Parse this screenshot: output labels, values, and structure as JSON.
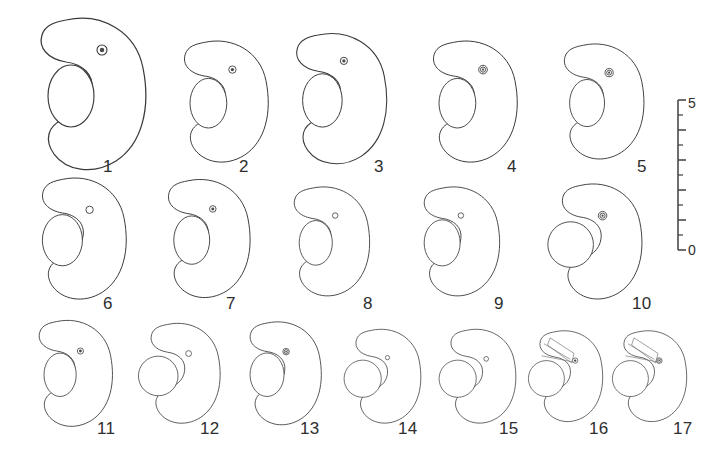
{
  "figure": {
    "type": "scientific-specimen-plate",
    "background_color": "#ffffff",
    "line_color": "#3a3a3a",
    "rows": 3,
    "specimen_count": 17
  },
  "specimens": [
    {
      "label": "1",
      "row": 1,
      "cx": 88,
      "cy": 92,
      "scale": 1.0,
      "lobe_style": "oval-inset",
      "dot": "ring-filled",
      "dot_dx": 14,
      "dot_dy": -42,
      "dot_r": 5.0,
      "extra": "none",
      "label_x": 103,
      "label_y": 158
    },
    {
      "label": "2",
      "row": 1,
      "cx": 222,
      "cy": 100,
      "scale": 0.8,
      "lobe_style": "oval-inset",
      "dot": "ring-filled",
      "dot_dx": 13,
      "dot_dy": -38,
      "dot_r": 4.6,
      "extra": "none",
      "label_x": 239,
      "label_y": 158
    },
    {
      "label": "3",
      "row": 1,
      "cx": 337,
      "cy": 97,
      "scale": 0.86,
      "lobe_style": "oval-inset",
      "dot": "ring-filled",
      "dot_dx": 8,
      "dot_dy": -42,
      "dot_r": 4.2,
      "extra": "none",
      "label_x": 374,
      "label_y": 158
    },
    {
      "label": "4",
      "row": 1,
      "cx": 471,
      "cy": 100,
      "scale": 0.8,
      "lobe_style": "oval-inset",
      "dot": "double-ring",
      "dot_dx": 15,
      "dot_dy": -38,
      "dot_r": 5.4,
      "extra": "none",
      "label_x": 507,
      "label_y": 158
    },
    {
      "label": "5",
      "row": 1,
      "cx": 600,
      "cy": 100,
      "scale": 0.76,
      "lobe_style": "oval-inset",
      "dot": "double-ring",
      "dot_dx": 12,
      "dot_dy": -36,
      "dot_r": 5.4,
      "extra": "none",
      "label_x": 637,
      "label_y": 158
    },
    {
      "label": "6",
      "row": 2,
      "cx": 80,
      "cy": 237,
      "scale": 0.8,
      "lobe_style": "oval-left",
      "dot": "ring-open",
      "dot_dx": 12,
      "dot_dy": -34,
      "dot_r": 4.6,
      "extra": "none",
      "label_x": 103,
      "label_y": 295
    },
    {
      "label": "7",
      "row": 2,
      "cx": 205,
      "cy": 237,
      "scale": 0.78,
      "lobe_style": "oval-inset",
      "dot": "ring-filled",
      "dot_dx": 10,
      "dot_dy": -36,
      "dot_r": 4.2,
      "extra": "none",
      "label_x": 226,
      "label_y": 295
    },
    {
      "label": "8",
      "row": 2,
      "cx": 328,
      "cy": 240,
      "scale": 0.72,
      "lobe_style": "oval-inset",
      "dot": "ring-open",
      "dot_dx": 10,
      "dot_dy": -34,
      "dot_r": 3.8,
      "extra": "none",
      "label_x": 363,
      "label_y": 295
    },
    {
      "label": "9",
      "row": 2,
      "cx": 458,
      "cy": 240,
      "scale": 0.72,
      "lobe_style": "oval-left",
      "dot": "ring-open",
      "dot_dx": 4,
      "dot_dy": -34,
      "dot_r": 3.8,
      "extra": "none",
      "label_x": 494,
      "label_y": 295
    },
    {
      "label": "10",
      "row": 2,
      "cx": 598,
      "cy": 240,
      "scale": 0.76,
      "lobe_style": "circle-protrude",
      "dot": "double-ring",
      "dot_dx": 6,
      "dot_dy": -32,
      "dot_r": 5.6,
      "extra": "none",
      "label_x": 632,
      "label_y": 295
    },
    {
      "label": "11",
      "row": 3,
      "cx": 72,
      "cy": 372,
      "scale": 0.7,
      "lobe_style": "oval-inset",
      "dot": "ring-filled",
      "dot_dx": 12,
      "dot_dy": -30,
      "dot_r": 4.4,
      "extra": "none",
      "label_x": 97,
      "label_y": 420
    },
    {
      "label": "12",
      "row": 3,
      "cx": 182,
      "cy": 372,
      "scale": 0.66,
      "lobe_style": "circle-protrude",
      "dot": "ring-open",
      "dot_dx": 10,
      "dot_dy": -28,
      "dot_r": 4.4,
      "extra": "none",
      "label_x": 200,
      "label_y": 420
    },
    {
      "label": "13",
      "row": 3,
      "cx": 282,
      "cy": 372,
      "scale": 0.68,
      "lobe_style": "oval-left",
      "dot": "double-ring",
      "dot_dx": 6,
      "dot_dy": -30,
      "dot_r": 4.8,
      "extra": "none",
      "label_x": 300,
      "label_y": 420
    },
    {
      "label": "14",
      "row": 3,
      "cx": 385,
      "cy": 375,
      "scale": 0.62,
      "lobe_style": "circle-protrude",
      "dot": "ring-open",
      "dot_dx": 4,
      "dot_dy": -28,
      "dot_r": 3.4,
      "extra": "none",
      "label_x": 398,
      "label_y": 420
    },
    {
      "label": "15",
      "row": 3,
      "cx": 480,
      "cy": 375,
      "scale": 0.62,
      "lobe_style": "circle-protrude",
      "dot": "ring-open",
      "dot_dx": 10,
      "dot_dy": -26,
      "dot_r": 3.8,
      "extra": "none",
      "label_x": 499,
      "label_y": 420
    },
    {
      "label": "16",
      "row": 3,
      "cx": 568,
      "cy": 375,
      "scale": 0.6,
      "lobe_style": "circle-protrude",
      "dot": "ring-filled",
      "dot_dx": 12,
      "dot_dy": -24,
      "dot_r": 4.4,
      "extra": "rays",
      "label_x": 589,
      "label_y": 420
    },
    {
      "label": "17",
      "row": 3,
      "cx": 652,
      "cy": 375,
      "scale": 0.6,
      "lobe_style": "circle-protrude",
      "dot": "double-ring",
      "dot_dx": 12,
      "dot_dy": -24,
      "dot_r": 4.8,
      "extra": "wedge",
      "label_x": 673,
      "label_y": 420
    }
  ],
  "scale_bar": {
    "orientation": "vertical",
    "top_label": "5",
    "bottom_label": "0",
    "x": 678,
    "y_top": 100,
    "y_bottom": 250,
    "major_divisions": 5,
    "minor_divisions_per_major": 2,
    "top_label_x": 688,
    "top_label_y": 96,
    "bottom_label_x": 688,
    "bottom_label_y": 243
  }
}
